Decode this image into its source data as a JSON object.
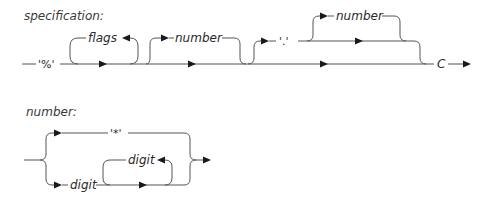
{
  "diagrams": [
    {
      "rule": "specification:",
      "sequence": [
        {
          "kind": "terminal",
          "text": "'%'"
        },
        {
          "kind": "loop-optional",
          "nonterminal": "flags"
        },
        {
          "kind": "optional",
          "nonterminal": "number"
        },
        {
          "kind": "optional-group",
          "items": [
            {
              "kind": "terminal",
              "text": "'.'"
            },
            {
              "kind": "optional",
              "nonterminal": "number"
            }
          ]
        },
        {
          "kind": "terminal",
          "text": "C"
        }
      ],
      "labels": {
        "percent": "'%'",
        "flags": "flags",
        "number1": "number",
        "dot": "'.'",
        "number2": "number",
        "conversion": "C"
      }
    },
    {
      "rule": "number:",
      "choices": [
        {
          "kind": "terminal",
          "text": "'*'"
        },
        {
          "kind": "sequence",
          "items": [
            "digit",
            {
              "kind": "loop-optional",
              "nonterminal": "digit"
            }
          ]
        }
      ],
      "labels": {
        "star": "'*'",
        "digit1": "digit",
        "digit2": "digit"
      }
    }
  ],
  "colors": {
    "line": "#555555",
    "arrow": "#1a1a1a",
    "text": "#2a2a2a"
  }
}
